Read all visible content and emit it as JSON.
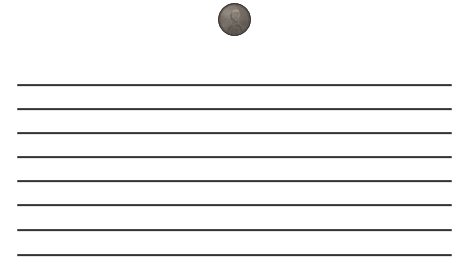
{
  "scene": {
    "width": 468,
    "height": 268,
    "background_color": "#ffffff",
    "description": "Ruled lined paper with a single US one-cent coin resting above the first line"
  },
  "coin": {
    "name": "us-penny",
    "denomination": "one cent",
    "obverse_subject": "Lincoln profile portrait facing right",
    "condition": "worn / circulated",
    "diameter_px": 33,
    "center_x": 234,
    "center_y": 19,
    "colors": {
      "rim": "#4a423c",
      "field_light": "#8d8379",
      "field_mid": "#6d645c",
      "field_dark": "#4b443e",
      "relief_highlight": "#a49a8f",
      "shadow": "#3a3430"
    }
  },
  "ruled_lines": {
    "count": 8,
    "color": "#2b2b2b",
    "thickness_px": 2,
    "x_start": 17,
    "x_end": 452,
    "y_positions": [
      84,
      108,
      132,
      156,
      180,
      204,
      229,
      254
    ]
  }
}
